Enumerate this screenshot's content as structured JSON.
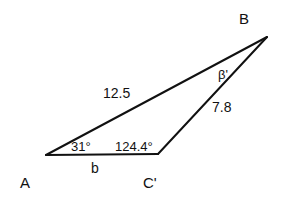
{
  "diagram": {
    "type": "triangle",
    "vertices": {
      "A": {
        "label": "A"
      },
      "B": {
        "label": "B"
      },
      "C": {
        "label": "C'"
      }
    },
    "sides": {
      "AB": {
        "label": "12.5"
      },
      "BC": {
        "label": "7.8"
      },
      "AC": {
        "label": "b"
      }
    },
    "angles": {
      "A": {
        "label": "31°"
      },
      "C": {
        "label": "124.4°"
      },
      "B": {
        "label": "β'"
      }
    },
    "colors": {
      "stroke": "#111111",
      "background": "#ffffff"
    }
  }
}
